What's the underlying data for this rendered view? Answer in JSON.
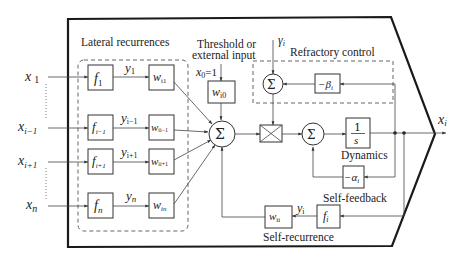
{
  "diagram": {
    "groups": {
      "lateral": "Lateral recurrences",
      "threshold_line1": "Threshold or",
      "threshold_line2": "external input",
      "refractory": "Refractory control",
      "dynamics": "Dynamics",
      "self_feedback": "Self-feedback",
      "self_recurrence": "Self-recurrence"
    },
    "inputs": [
      {
        "label": "x",
        "sub": "1"
      },
      {
        "label": "x",
        "sub": "i−1"
      },
      {
        "label": "x",
        "sub": "i+1"
      },
      {
        "label": "x",
        "sub": "n"
      }
    ],
    "activation_blocks": [
      {
        "label": "f",
        "sub": "1"
      },
      {
        "label": "f",
        "sub": "i−1"
      },
      {
        "label": "f",
        "sub": "i+1"
      },
      {
        "label": "f",
        "sub": "n"
      }
    ],
    "signals": [
      {
        "label": "y",
        "sub": "1"
      },
      {
        "label": "y",
        "sub": "i−1"
      },
      {
        "label": "y",
        "sub": "i+1"
      },
      {
        "label": "y",
        "sub": "n"
      }
    ],
    "weight_blocks": [
      {
        "label": "w",
        "sub": "i1"
      },
      {
        "label": "w",
        "sub": "ii−1"
      },
      {
        "label": "w",
        "sub": "ii+1"
      },
      {
        "label": "w",
        "sub": "in"
      }
    ],
    "bias": {
      "x0": "x",
      "x0_sub": "0",
      "x0_eq": "=1",
      "weight": "w",
      "weight_sub": "i0"
    },
    "sum_symbol": "Σ",
    "gamma": {
      "label": "γ",
      "sub": "i"
    },
    "beta_block": {
      "label": "−β",
      "sub": "i"
    },
    "integrator": {
      "num": "1",
      "den": "s"
    },
    "alpha_block": {
      "label": "−α",
      "sub": "i"
    },
    "self_f": {
      "label": "f",
      "sub": "i"
    },
    "self_w": {
      "label": "w",
      "sub": "ii"
    },
    "self_y": {
      "label": "y",
      "sub": "i"
    },
    "output": {
      "label": "x",
      "sub": "i"
    }
  }
}
